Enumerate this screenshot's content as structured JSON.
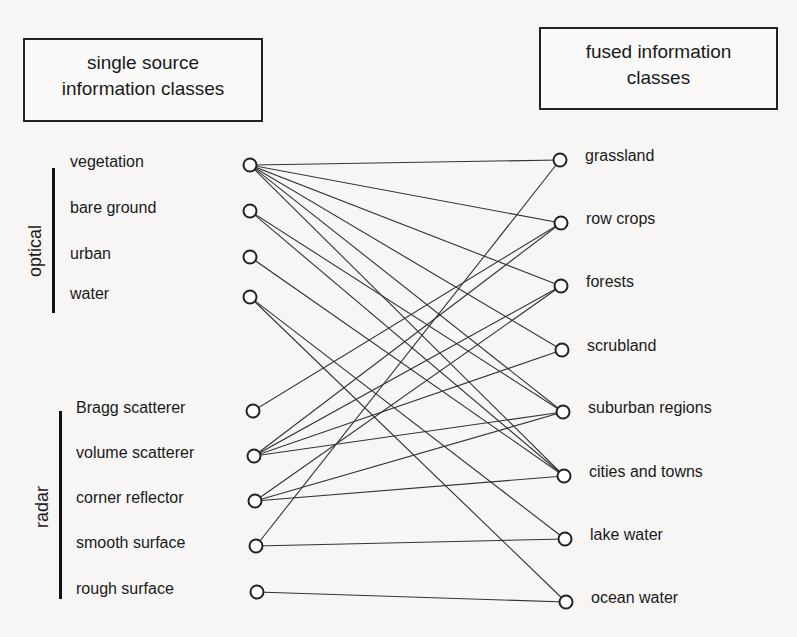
{
  "left_box": {
    "line1": "single source",
    "line2": "information classes"
  },
  "right_box": {
    "line1": "fused information",
    "line2": "classes"
  },
  "groups": [
    {
      "label": "optical",
      "items": [
        "vegetation",
        "bare ground",
        "urban",
        "water"
      ]
    },
    {
      "label": "radar",
      "items": [
        "Bragg scatterer",
        "volume scatterer",
        "corner reflector",
        "smooth surface",
        "rough surface"
      ]
    }
  ],
  "left_nodes": [
    {
      "id": "vegetation",
      "label": "vegetation",
      "x": 250,
      "y": 165
    },
    {
      "id": "bare_ground",
      "label": "bare ground",
      "x": 250,
      "y": 211
    },
    {
      "id": "urban",
      "label": "urban",
      "x": 250,
      "y": 257
    },
    {
      "id": "water",
      "label": "water",
      "x": 250,
      "y": 297
    },
    {
      "id": "bragg",
      "label": "Bragg scatterer",
      "x": 253,
      "y": 411
    },
    {
      "id": "volume",
      "label": "volume scatterer",
      "x": 254,
      "y": 456
    },
    {
      "id": "corner",
      "label": "corner reflector",
      "x": 255,
      "y": 501
    },
    {
      "id": "smooth",
      "label": "smooth surface",
      "x": 256,
      "y": 546
    },
    {
      "id": "rough",
      "label": "rough surface",
      "x": 257,
      "y": 592
    }
  ],
  "right_nodes": [
    {
      "id": "grassland",
      "label": "grassland",
      "x": 560,
      "y": 160
    },
    {
      "id": "row_crops",
      "label": "row crops",
      "x": 561,
      "y": 223
    },
    {
      "id": "forests",
      "label": "forests",
      "x": 561,
      "y": 286
    },
    {
      "id": "scrubland",
      "label": "scrubland",
      "x": 562,
      "y": 350
    },
    {
      "id": "suburban",
      "label": "suburban regions",
      "x": 563,
      "y": 412
    },
    {
      "id": "cities",
      "label": "cities and towns",
      "x": 564,
      "y": 476
    },
    {
      "id": "lake",
      "label": "lake water",
      "x": 565,
      "y": 539
    },
    {
      "id": "ocean",
      "label": "ocean water",
      "x": 566,
      "y": 602
    }
  ],
  "edges": [
    [
      "vegetation",
      "grassland"
    ],
    [
      "vegetation",
      "row_crops"
    ],
    [
      "vegetation",
      "forests"
    ],
    [
      "vegetation",
      "scrubland"
    ],
    [
      "vegetation",
      "suburban"
    ],
    [
      "vegetation",
      "cities"
    ],
    [
      "bare_ground",
      "suburban"
    ],
    [
      "bare_ground",
      "cities"
    ],
    [
      "urban",
      "cities"
    ],
    [
      "water",
      "lake"
    ],
    [
      "water",
      "ocean"
    ],
    [
      "bragg",
      "row_crops"
    ],
    [
      "volume",
      "row_crops"
    ],
    [
      "volume",
      "forests"
    ],
    [
      "volume",
      "scrubland"
    ],
    [
      "volume",
      "suburban"
    ],
    [
      "corner",
      "forests"
    ],
    [
      "corner",
      "suburban"
    ],
    [
      "corner",
      "cities"
    ],
    [
      "smooth",
      "grassland"
    ],
    [
      "smooth",
      "lake"
    ],
    [
      "rough",
      "ocean"
    ]
  ]
}
